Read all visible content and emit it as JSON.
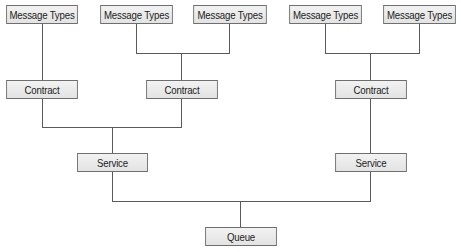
{
  "diagram": {
    "type": "hierarchy",
    "colors": {
      "box_fill": "#ebebeb",
      "box_border": "#6e6e6e",
      "line": "#5a5a5a",
      "text": "#222222"
    },
    "nodes": {
      "mt1": {
        "label": "Message Types"
      },
      "mt2": {
        "label": "Message Types"
      },
      "mt3": {
        "label": "Message Types"
      },
      "mt4": {
        "label": "Message Types"
      },
      "mt5": {
        "label": "Message Types"
      },
      "contract1": {
        "label": "Contract"
      },
      "contract2": {
        "label": "Contract"
      },
      "contract3": {
        "label": "Contract"
      },
      "service1": {
        "label": "Service"
      },
      "service2": {
        "label": "Service"
      },
      "queue": {
        "label": "Queue"
      }
    },
    "edges": [
      [
        "mt1",
        "contract1"
      ],
      [
        "mt2",
        "contract2"
      ],
      [
        "mt3",
        "contract2"
      ],
      [
        "mt4",
        "contract3"
      ],
      [
        "mt5",
        "contract3"
      ],
      [
        "contract1",
        "service1"
      ],
      [
        "contract2",
        "service1"
      ],
      [
        "contract3",
        "service2"
      ],
      [
        "service1",
        "queue"
      ],
      [
        "service2",
        "queue"
      ]
    ]
  }
}
